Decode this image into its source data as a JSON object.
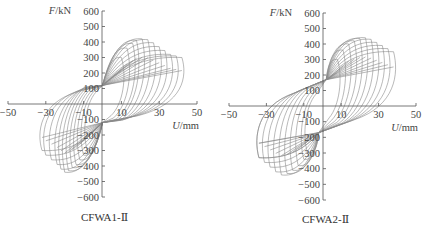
{
  "chart_data": [
    {
      "type": "line",
      "title": "CFWA1-Ⅱ",
      "subtitle": "Hysteresis curves (force vs. displacement)",
      "xlabel": "U/mm",
      "ylabel": "F/kN",
      "xlim": [
        -50,
        50
      ],
      "ylim": [
        -600,
        600
      ],
      "x_ticks": [
        -50,
        -30,
        -10,
        10,
        30,
        50
      ],
      "y_ticks": [
        600,
        500,
        400,
        300,
        200,
        100,
        -100,
        -200,
        -300,
        -400,
        -500,
        -600
      ],
      "grid": false,
      "legend": "none",
      "line_color": "#8a8a8a",
      "pinch_point_pos": {
        "x": 0,
        "y": 120
      },
      "pinch_point_neg": {
        "x": 0,
        "y": -120
      },
      "series": [
        {
          "name": "cycle peaks (positive)",
          "x": [
            10,
            13,
            16,
            18,
            21,
            24,
            27,
            30,
            33,
            36,
            39,
            42
          ],
          "y": [
            300,
            360,
            390,
            410,
            420,
            415,
            395,
            370,
            345,
            320,
            310,
            300
          ]
        },
        {
          "name": "cycle peaks (negative)",
          "x": [
            -8,
            -10,
            -12,
            -14,
            -16,
            -18,
            -20,
            -22,
            -24,
            -27,
            -30,
            -32
          ],
          "y": [
            -300,
            -330,
            -360,
            -390,
            -410,
            -430,
            -440,
            -420,
            -390,
            -360,
            -330,
            -300
          ]
        }
      ]
    },
    {
      "type": "line",
      "title": "CFWA2-Ⅱ",
      "subtitle": "Hysteresis curves (force vs. displacement)",
      "xlabel": "U/mm",
      "ylabel": "F/kN",
      "xlim": [
        -50,
        50
      ],
      "ylim": [
        -600,
        600
      ],
      "x_ticks": [
        -50,
        -30,
        -10,
        10,
        30,
        50
      ],
      "y_ticks": [
        600,
        500,
        400,
        300,
        200,
        100,
        -100,
        -200,
        -300,
        -400,
        -500,
        -600
      ],
      "grid": false,
      "legend": "none",
      "line_color": "#8a8a8a",
      "pinch_point_pos": {
        "x": 2,
        "y": 170
      },
      "pinch_point_neg": {
        "x": -2,
        "y": -170
      },
      "series": [
        {
          "name": "cycle peaks (positive)",
          "x": [
            8,
            11,
            14,
            17,
            20,
            23,
            26,
            29,
            32,
            35,
            38
          ],
          "y": [
            300,
            360,
            400,
            420,
            435,
            440,
            430,
            410,
            390,
            370,
            350
          ]
        },
        {
          "name": "cycle peaks (negative)",
          "x": [
            -8,
            -10,
            -13,
            -16,
            -19,
            -22,
            -25,
            -28,
            -31,
            -34
          ],
          "y": [
            -300,
            -340,
            -380,
            -410,
            -430,
            -440,
            -420,
            -390,
            -360,
            -330
          ]
        }
      ]
    }
  ],
  "charts": [
    {
      "caption": "CFWA1-Ⅱ",
      "ylabel_var": "F",
      "ylabel_unit": "/kN",
      "xlabel_var": "U",
      "xlabel_unit": "/mm"
    },
    {
      "caption": "CFWA2-Ⅱ",
      "ylabel_var": "F",
      "ylabel_unit": "/kN",
      "xlabel_var": "U",
      "xlabel_unit": "/mm"
    }
  ]
}
